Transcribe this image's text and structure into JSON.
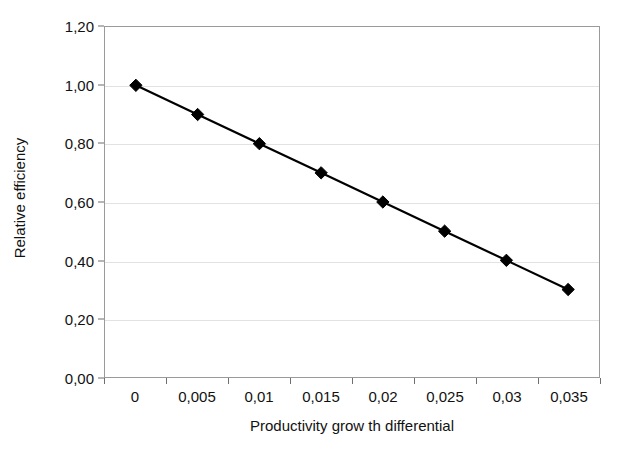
{
  "chart_data": {
    "type": "line",
    "title": "",
    "xlabel": "Productivity grow th differential",
    "ylabel": "Relative efficiency",
    "categories": [
      "0",
      "0,005",
      "0,01",
      "0,015",
      "0,02",
      "0,025",
      "0,03",
      "0,035"
    ],
    "x": [
      0,
      0.005,
      0.01,
      0.015,
      0.02,
      0.025,
      0.03,
      0.035
    ],
    "values": [
      1.0,
      0.9,
      0.8,
      0.7,
      0.6,
      0.5,
      0.4,
      0.3
    ],
    "point_labels": [
      "1,00",
      "0,90",
      "0,80",
      "0,70",
      "0,60",
      "0,50",
      "0,40",
      "0,30"
    ],
    "ylim": [
      0,
      1.2
    ],
    "y_ticks": [
      0,
      0.2,
      0.4,
      0.6,
      0.8,
      1.0,
      1.2
    ],
    "y_tick_labels": [
      "0,00",
      "0,20",
      "0,40",
      "0,60",
      "0,80",
      "1,00",
      "1,20"
    ],
    "grid": true,
    "grid_axis": "y",
    "legend": false,
    "legend_position": "none",
    "marker": "diamond",
    "series_color": "#000000",
    "gridline_color": "#e2e2e2",
    "axis_color": "#9a9a9a",
    "background_color": "#ffffff"
  }
}
